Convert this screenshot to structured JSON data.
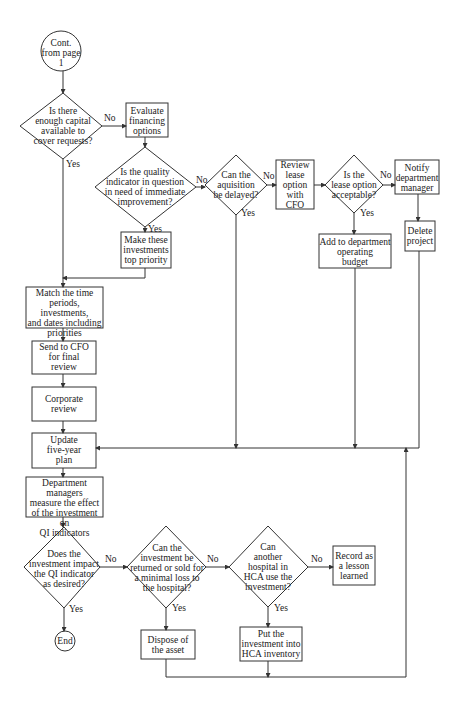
{
  "diagram": {
    "type": "flowchart",
    "nodes": {
      "start": {
        "shape": "circle",
        "text": "Cont.\nfrom page\n1"
      },
      "d_capital": {
        "shape": "diamond",
        "text": "Is there\nenough capital\navailable to\ncover requests?"
      },
      "evaluate_financing": {
        "shape": "box",
        "text": "Evaluate\nfinancing\noptions"
      },
      "d_quality": {
        "shape": "diamond",
        "text": "Is the quality\nindicator in question\nin need of immediate\nimprovement?"
      },
      "d_delay": {
        "shape": "diamond",
        "text": "Can the\naquisition\nbe delayed?"
      },
      "review_lease": {
        "shape": "box",
        "text": "Review\nlease\noption\nwith\nCFO"
      },
      "d_lease": {
        "shape": "diamond",
        "text": "Is the\nlease option\nacceptable?"
      },
      "notify_manager": {
        "shape": "box",
        "text": "Notify\ndepartment\nmanager"
      },
      "top_priority": {
        "shape": "box",
        "text": "Make these\ninvestments\ntop priority"
      },
      "add_budget": {
        "shape": "box",
        "text": "Add to department\noperating\nbudget"
      },
      "delete_project": {
        "shape": "box",
        "text": "Delete\nproject"
      },
      "match_periods": {
        "shape": "box",
        "text": "Match the time\nperiods, investments,\nand dates including\npriorities"
      },
      "send_cfo": {
        "shape": "box",
        "text": "Send to CFO\nfor final\nreview"
      },
      "corporate_review": {
        "shape": "box",
        "text": "Corporate\nreview"
      },
      "update_plan": {
        "shape": "box",
        "text": "Update\nfive-year\nplan"
      },
      "measure_effect": {
        "shape": "box",
        "text": "Department managers\nmeasure the effect\nof the investment on\nQI indicators"
      },
      "d_impact": {
        "shape": "diamond",
        "text": "Does the\ninvestment impact\nthe QI indicator\nas desired?"
      },
      "d_return": {
        "shape": "diamond",
        "text": "Can the\ninvestment be\nreturned or sold for\na minimal  loss to\nthe hospital?"
      },
      "d_other_hospital": {
        "shape": "diamond",
        "text": "Can\nanother\nhospital in\nHCA use the\ninvestment?"
      },
      "lesson": {
        "shape": "box",
        "text": "Record as\na lesson\nlearned"
      },
      "end": {
        "shape": "circle",
        "text": "End"
      },
      "dispose": {
        "shape": "box",
        "text": "Dispose of\nthe asset"
      },
      "hca_inventory": {
        "shape": "box",
        "text": "Put the\ninvestment into\nHCA inventory"
      }
    },
    "edge_labels": {
      "yes": "Yes",
      "no": "No"
    }
  }
}
